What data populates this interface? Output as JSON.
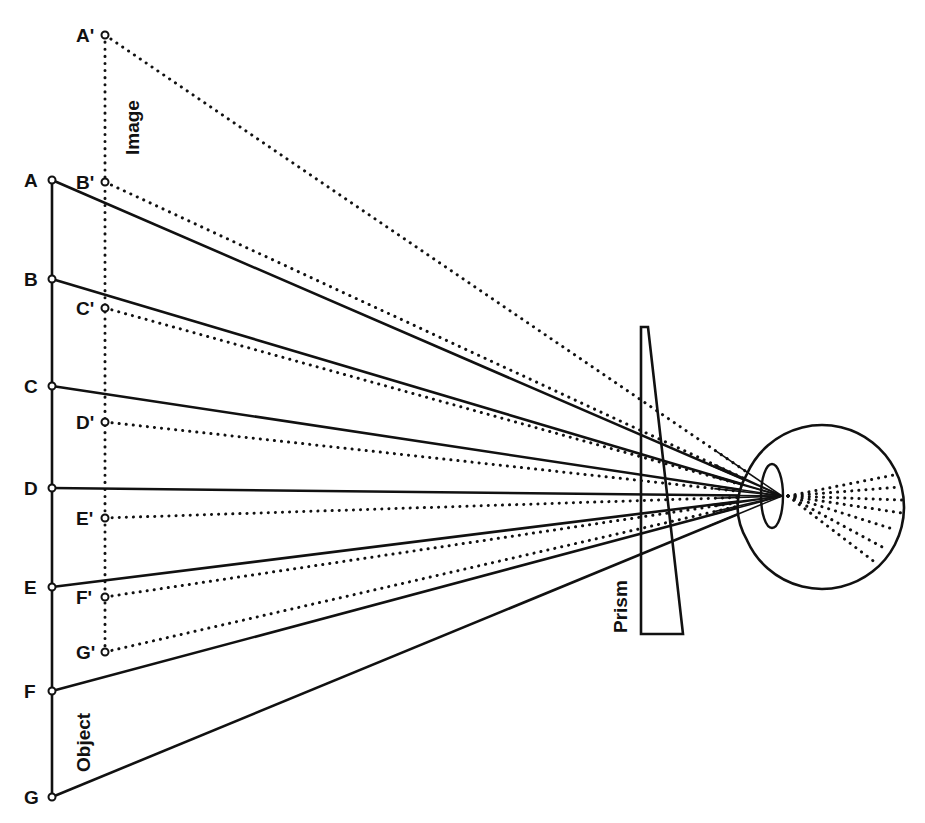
{
  "diagram": {
    "title_labels": {
      "image": "Image",
      "object": "Object",
      "prism": "Prism"
    },
    "colors": {
      "ink": "#111111",
      "background": "#ffffff"
    },
    "object_points": [
      {
        "label": "A",
        "x": 52,
        "y": 180
      },
      {
        "label": "B",
        "x": 52,
        "y": 279
      },
      {
        "label": "C",
        "x": 52,
        "y": 386
      },
      {
        "label": "D",
        "x": 52,
        "y": 488
      },
      {
        "label": "E",
        "x": 52,
        "y": 587
      },
      {
        "label": "F",
        "x": 52,
        "y": 691
      },
      {
        "label": "G",
        "x": 52,
        "y": 797
      }
    ],
    "image_points": [
      {
        "label": "A'",
        "x": 105,
        "y": 35
      },
      {
        "label": "B'",
        "x": 105,
        "y": 182
      },
      {
        "label": "C'",
        "x": 105,
        "y": 308
      },
      {
        "label": "D'",
        "x": 105,
        "y": 422
      },
      {
        "label": "E'",
        "x": 105,
        "y": 518
      },
      {
        "label": "F'",
        "x": 105,
        "y": 597
      },
      {
        "label": "G'",
        "x": 105,
        "y": 652
      }
    ],
    "focal_point": {
      "x": 782,
      "y": 496
    },
    "prism": {
      "top_left": [
        641,
        327
      ],
      "top_right": [
        648,
        327
      ],
      "bottom_right": [
        683,
        634
      ],
      "bottom_left": [
        641,
        634
      ]
    },
    "eye": {
      "cx": 822,
      "cy": 507,
      "r": 82,
      "lens_cx": 772,
      "lens_cy": 496,
      "lens_rx": 11,
      "lens_ry": 32
    },
    "retina_rays": [
      {
        "x": 894,
        "y": 475
      },
      {
        "x": 900,
        "y": 487
      },
      {
        "x": 903,
        "y": 500
      },
      {
        "x": 902,
        "y": 513
      },
      {
        "x": 896,
        "y": 530
      },
      {
        "x": 886,
        "y": 549
      },
      {
        "x": 876,
        "y": 563
      }
    ]
  }
}
